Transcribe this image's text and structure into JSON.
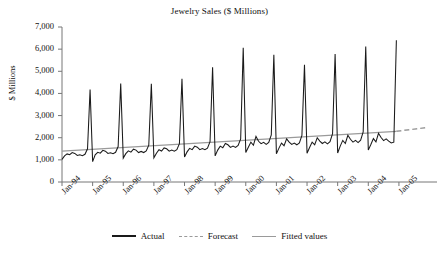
{
  "chart_data": {
    "type": "line",
    "title": "Jewelry Sales ($ Millions)",
    "xlabel": "",
    "ylabel": "$ Millions",
    "ylim": [
      0,
      7000
    ],
    "ytick_values": [
      7000,
      6000,
      5000,
      4000,
      3000,
      2000,
      1000,
      0
    ],
    "ytick_labels": [
      "7,000",
      "6,000",
      "5,000",
      "4,000",
      "3,000",
      "2,000",
      "1,000",
      "0"
    ],
    "grid": false,
    "legend_position": "bottom-center",
    "x_tick_labels": [
      "Jan-94",
      "Jan-95",
      "Jan-96",
      "Jan-97",
      "Jan-98",
      "Jan-99",
      "Jan-00",
      "Jan-01",
      "Jan-02",
      "Jan-03",
      "Jan-04",
      "Jan-05"
    ],
    "x_tick_index": [
      0,
      12,
      24,
      36,
      48,
      60,
      72,
      84,
      96,
      108,
      120,
      132
    ],
    "x_range_months": [
      "Jan-94",
      "Dec-05"
    ],
    "colors": {
      "actual": "#1a1a1a",
      "forecast": "#9a9a9a",
      "fitted": "#9a9a9a",
      "axis": "#777777",
      "background": "#ffffff"
    },
    "series": [
      {
        "name": "Actual",
        "style": "solid",
        "color": "#1a1a1a",
        "start_index": 0,
        "values": [
          1020,
          1180,
          1270,
          1230,
          1330,
          1290,
          1200,
          1230,
          1190,
          1250,
          1500,
          4180,
          920,
          1230,
          1340,
          1300,
          1430,
          1390,
          1290,
          1320,
          1280,
          1340,
          1600,
          4450,
          1080,
          1280,
          1410,
          1350,
          1480,
          1440,
          1330,
          1380,
          1330,
          1400,
          1660,
          4440,
          1090,
          1300,
          1460,
          1400,
          1540,
          1500,
          1390,
          1440,
          1390,
          1460,
          1730,
          4660,
          1130,
          1360,
          1520,
          1460,
          1620,
          1570,
          1460,
          1510,
          1460,
          1530,
          1820,
          5180,
          1180,
          1440,
          1620,
          1550,
          1740,
          1680,
          1560,
          1620,
          1560,
          1650,
          1950,
          6060,
          1330,
          1570,
          1800,
          1660,
          2060,
          1840,
          1730,
          1790,
          1700,
          1790,
          2130,
          5750,
          1280,
          1530,
          1760,
          1640,
          1950,
          1800,
          1700,
          1760,
          1680,
          1770,
          2100,
          5290,
          1300,
          1560,
          1800,
          1680,
          2000,
          1850,
          1740,
          1810,
          1720,
          1820,
          2180,
          5780,
          1310,
          1620,
          1880,
          1740,
          2110,
          1930,
          1800,
          1880,
          1780,
          1890,
          2260,
          6120,
          1440,
          1690,
          1960,
          1810,
          2200,
          2010,
          1870,
          1950,
          1850,
          1760,
          1800,
          6400
        ]
      },
      {
        "name": "Fitted values",
        "style": "solid",
        "color": "#9a9a9a",
        "start_index": 0,
        "description": "linear trend across fitted span",
        "endpoints": [
          {
            "index": 0,
            "value": 1390
          },
          {
            "index": 131,
            "value": 2290
          }
        ]
      },
      {
        "name": "Forecast",
        "style": "dashed",
        "color": "#9a9a9a",
        "description": "dashed extension of trend beyond last actual observation",
        "endpoints": [
          {
            "index": 131,
            "value": 2290
          },
          {
            "index": 143,
            "value": 2460
          }
        ]
      }
    ]
  },
  "legend": {
    "entries": [
      {
        "label": "Actual",
        "style": "solid",
        "color": "#1a1a1a"
      },
      {
        "label": "Forecast",
        "style": "dashed",
        "color": "#9a9a9a"
      },
      {
        "label": "Fitted values",
        "style": "solid",
        "color": "#9a9a9a"
      }
    ]
  }
}
